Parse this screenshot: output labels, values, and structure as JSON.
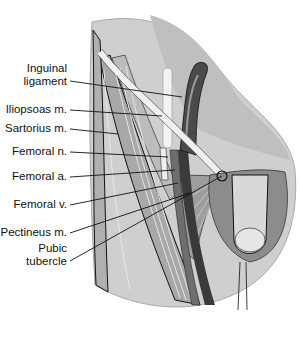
{
  "figure": {
    "labels": [
      {
        "id": "inguinal-ligament",
        "line1": "Inguinal",
        "line2": "ligament",
        "x": 69,
        "y": 75,
        "tx": 182,
        "ty": 97
      },
      {
        "id": "iliopsoas",
        "line1": "Iliopsoas m.",
        "line2": "",
        "x": 69,
        "y": 109,
        "tx": 162,
        "ty": 116
      },
      {
        "id": "sartorius",
        "line1": "Sartorius m.",
        "line2": "",
        "x": 69,
        "y": 128,
        "tx": 118,
        "ty": 134
      },
      {
        "id": "femoral-n",
        "line1": "Femoral n.",
        "line2": "",
        "x": 69,
        "y": 151,
        "tx": 168,
        "ty": 157
      },
      {
        "id": "femoral-a",
        "line1": "Femoral a.",
        "line2": "",
        "x": 69,
        "y": 176,
        "tx": 175,
        "ty": 170
      },
      {
        "id": "femoral-v",
        "line1": "Femoral v.",
        "line2": "",
        "x": 69,
        "y": 204,
        "tx": 178,
        "ty": 183
      },
      {
        "id": "pectineus",
        "line1": "Pectineus m.",
        "line2": "",
        "x": 69,
        "y": 232,
        "tx": 190,
        "ty": 193
      },
      {
        "id": "pubic-tubercle",
        "line1": "Pubic",
        "line2": "tubercle",
        "x": 69,
        "y": 255,
        "tx": 222,
        "ty": 176
      }
    ],
    "colors": {
      "ink": "#111111",
      "skin_light": "#d9d9d9",
      "skin_mid": "#bdbdbd",
      "muscle_dark": "#8a8a8a",
      "vessel_dark": "#3a3a3a",
      "ligament": "#e8e8e8"
    }
  }
}
